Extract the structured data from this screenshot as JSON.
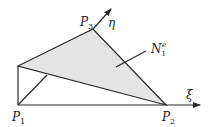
{
  "diagram": {
    "colors": {
      "fill": "#e4e4e4",
      "stroke": "#2a2a2a",
      "background": "#ffffff"
    },
    "points": {
      "P1": {
        "label": "P",
        "sub": "1",
        "x": 18,
        "y": 105
      },
      "P2": {
        "label": "P",
        "sub": "2",
        "x": 166,
        "y": 105
      },
      "P3": {
        "label": "P",
        "sub": "3",
        "x": 93,
        "y": 29
      },
      "top_left": {
        "x": 18,
        "y": 66
      }
    },
    "axes": {
      "xi": {
        "label": "ξ",
        "tip_x": 200,
        "tip_y": 105
      },
      "eta": {
        "label": "η",
        "tip_x": 111,
        "tip_y": 9
      }
    },
    "annotation": {
      "label": "N",
      "sub": "1",
      "sup": "e"
    }
  }
}
